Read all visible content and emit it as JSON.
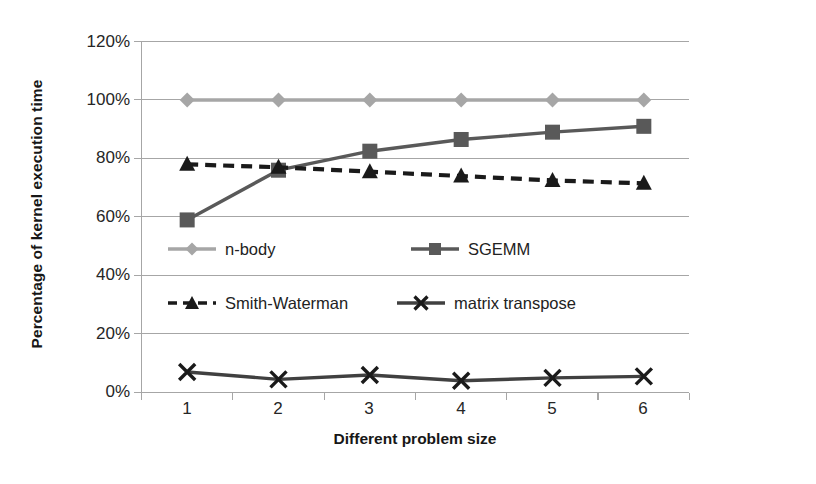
{
  "chart_data": {
    "type": "line",
    "title": "",
    "xlabel": "Different problem size",
    "ylabel": "Percentage of kernel execution time",
    "categories": [
      "1",
      "2",
      "3",
      "4",
      "5",
      "6"
    ],
    "x": [
      1,
      2,
      3,
      4,
      5,
      6
    ],
    "ylim": [
      0,
      120
    ],
    "ytick_values": [
      0,
      20,
      40,
      60,
      80,
      100,
      120
    ],
    "ytick_labels": [
      "0%",
      "20%",
      "40%",
      "60%",
      "80%",
      "100%",
      "120%"
    ],
    "grid": "horizontal",
    "legend_position": "inside-center",
    "series": [
      {
        "name": "n-body",
        "marker": "diamond",
        "color": "#a6a6a6",
        "dash": "solid",
        "values": [
          100,
          100,
          100,
          100,
          100,
          100
        ]
      },
      {
        "name": "SGEMM",
        "marker": "square",
        "color": "#595959",
        "dash": "solid",
        "values": [
          59,
          76,
          82.5,
          86.5,
          89,
          91
        ]
      },
      {
        "name": "Smith-Waterman",
        "marker": "triangle",
        "color": "#1a1a1a",
        "dash": "dashed",
        "values": [
          78,
          77,
          75.5,
          74,
          72.5,
          71.5
        ]
      },
      {
        "name": "matrix transpose",
        "marker": "cross",
        "color": "#404040",
        "dash": "solid",
        "values": [
          7,
          4.5,
          6,
          4,
          5,
          5.5
        ]
      }
    ]
  },
  "axis": {
    "y_title": "Percentage of kernel execution time",
    "x_title": "Different problem size",
    "y_labels": [
      "120%",
      "100%",
      "80%",
      "60%",
      "40%",
      "20%",
      "0%"
    ],
    "x_labels": [
      "1",
      "2",
      "3",
      "4",
      "5",
      "6"
    ]
  },
  "legend": {
    "items": [
      {
        "label": "n-body",
        "icon": "diamond-marker-icon",
        "color": "#a6a6a6"
      },
      {
        "label": "SGEMM",
        "icon": "square-marker-icon",
        "color": "#595959"
      },
      {
        "label": "Smith-Waterman",
        "icon": "triangle-marker-icon",
        "color": "#1a1a1a"
      },
      {
        "label": "matrix transpose",
        "icon": "cross-marker-icon",
        "color": "#404040"
      }
    ]
  },
  "colors": {
    "background": "#ffffff",
    "gridline": "#a6a6a6",
    "axis": "#a6a6a6",
    "text": "#262626"
  }
}
